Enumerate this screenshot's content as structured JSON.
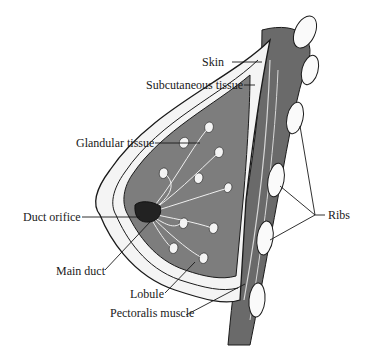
{
  "figure": {
    "type": "anatomical cross-section diagram",
    "labels": {
      "skin": "Skin",
      "subcutaneous": "Subcutaneous tissue",
      "glandular": "Glandular tissue",
      "duct_orifice": "Duct orifice",
      "main_duct": "Main duct",
      "lobule": "Lobule",
      "pectoralis": "Pectoralis muscle",
      "ribs": "Ribs"
    },
    "colors": {
      "tissue_gray": "#7d7d7d",
      "muscle_gray": "#6a6a6a",
      "fat_white": "#f4f4f4",
      "outline": "#1a1a1a",
      "rib_white": "#fafafa"
    }
  }
}
